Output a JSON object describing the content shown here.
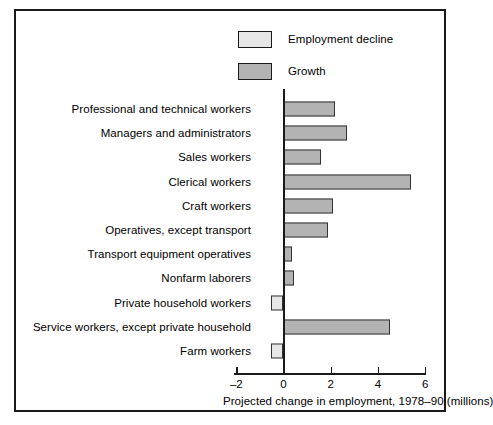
{
  "chart_data": {
    "type": "bar",
    "orientation": "horizontal",
    "title": "",
    "xlabel": "Projected change in employment, 1978–90 (millions)",
    "ylabel": "",
    "xlim": [
      -2,
      6
    ],
    "xticks": [
      -2,
      0,
      2,
      4,
      6
    ],
    "xtick_labels": [
      "–2",
      "0",
      "2",
      "4",
      "6"
    ],
    "grid": false,
    "legend_position": "top-center",
    "legend": [
      {
        "label": "Employment decline",
        "color": "#e6e6e6"
      },
      {
        "label": "Growth",
        "color": "#b3b3b3"
      }
    ],
    "categories": [
      "Professional and technical workers",
      "Managers and administrators",
      "Sales workers",
      "Clerical workers",
      "Craft workers",
      "Operatives, except transport",
      "Transport equipment operatives",
      "Nonfarm laborers",
      "Private household workers",
      "Service workers, except private household",
      "Farm workers"
    ],
    "values": [
      2.2,
      2.7,
      1.6,
      5.4,
      2.1,
      1.9,
      0.35,
      0.45,
      -0.55,
      4.5,
      -0.55
    ],
    "series_name": "Projected change in employment"
  }
}
